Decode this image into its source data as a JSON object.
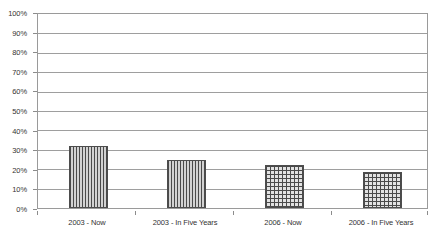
{
  "chart_data": {
    "type": "bar",
    "title": "",
    "xlabel": "",
    "ylabel": "",
    "categories": [
      "2003 - Now",
      "2003 - In Five Years",
      "2006 - Now",
      "2006 - In Five Years"
    ],
    "values": [
      32,
      25,
      22,
      18.5
    ],
    "value_labels": [
      "32%",
      "25%",
      "22%",
      "18.5%"
    ],
    "ylim": [
      0,
      100
    ],
    "ytick_labels": [
      "100%",
      "90%",
      "80%",
      "70%",
      "60%",
      "50%",
      "40%",
      "30%",
      "20%",
      "10%",
      "0%"
    ],
    "ytick_values": [
      100,
      90,
      80,
      70,
      60,
      50,
      40,
      30,
      20,
      10,
      0
    ],
    "grid": true,
    "grid_axis": "y",
    "legend": "none",
    "bar_patterns": [
      "vertical-lines",
      "vertical-lines",
      "crosshatch",
      "crosshatch"
    ],
    "colors": {
      "frame": "#9a9a9a",
      "gridline": "#9e9e9e",
      "bar_outline": "#4d4d4d",
      "bar_hatch": "#4a4a4a",
      "bar_fill_vertical": "#c9c9c9",
      "bar_fill_crosshatch": "#e2e2e2",
      "text": "#333333",
      "background": "#ffffff"
    }
  }
}
